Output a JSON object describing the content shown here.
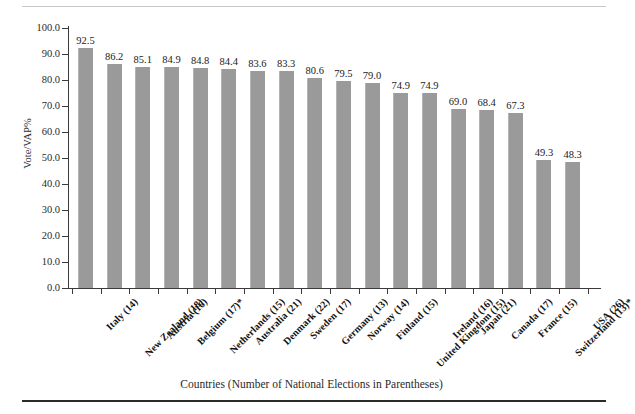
{
  "chart_data": {
    "type": "bar",
    "title": "",
    "subtitle": "",
    "xlabel": "Countries (Number of National Elections in Parentheses)",
    "ylabel": "Vote/VAP%",
    "ylim": [
      0.0,
      100.0
    ],
    "ytick_step": 10.0,
    "grid": false,
    "legend": null,
    "bar_color": "#9a9a9a",
    "axis_color": "#3a3a3a",
    "categories": [
      "Italy (14)",
      "New Zealand (18)",
      "Austria (16)",
      "Belgium (17)*",
      "Netherlands (15)",
      "Australia (21)",
      "Denmark (22)",
      "Sweden (17)",
      "Germany (13)",
      "Norway (14)",
      "Finland (15)",
      "United Kingdom (15)",
      "Ireland (16)",
      "Japan (21)",
      "Canada (17)",
      "France (15)",
      "Switzerland (13)*",
      "USA (26)"
    ],
    "values": [
      92.5,
      86.2,
      85.1,
      84.9,
      84.8,
      84.4,
      83.6,
      83.3,
      80.6,
      79.5,
      79.0,
      74.9,
      74.9,
      69.0,
      68.4,
      67.3,
      49.3,
      48.3
    ],
    "value_labels": [
      "92.5",
      "86.2",
      "85.1",
      "84.9",
      "84.8",
      "84.4",
      "83.6",
      "83.3",
      "80.6",
      "79.5",
      "79.0",
      "74.9",
      "74.9",
      "69.0",
      "68.4",
      "67.3",
      "49.3",
      "48.3"
    ],
    "ytick_labels": [
      "0.0",
      "10.0",
      "20.0",
      "30.0",
      "40.0",
      "50.0",
      "60.0",
      "70.0",
      "80.0",
      "90.0",
      "100.0"
    ],
    "ytick_values": [
      0,
      10,
      20,
      30,
      40,
      50,
      60,
      70,
      80,
      90,
      100
    ],
    "elections_counts": [
      14,
      18,
      16,
      17,
      15,
      21,
      22,
      17,
      13,
      14,
      15,
      15,
      16,
      21,
      17,
      15,
      13,
      26
    ],
    "footnote_marker": "*"
  }
}
